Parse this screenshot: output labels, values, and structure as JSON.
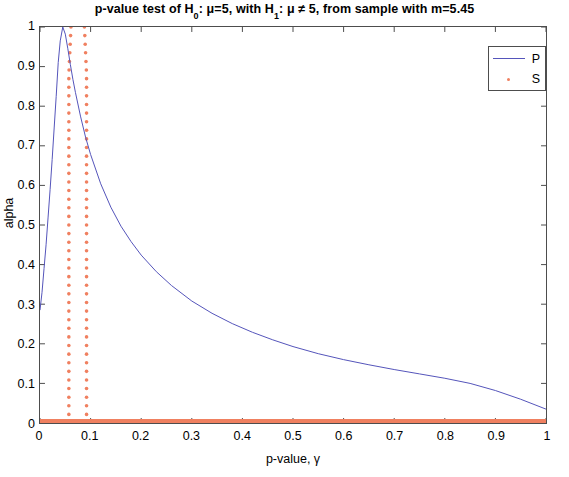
{
  "chart_data": {
    "type": "line",
    "title_parts": {
      "a": "p-value test of  H",
      "sub1": "0",
      "b": ": μ=5, with H",
      "sub2": "1",
      "c": ": μ ≠ 5, from sample with m=5.45"
    },
    "xlabel": "p-value, γ",
    "ylabel": "alpha",
    "xlim": [
      0,
      1
    ],
    "ylim": [
      0,
      1
    ],
    "grid": false,
    "legend_position": "top-right",
    "legend": [
      {
        "name": "P",
        "marker": "line",
        "color": "#5555bb"
      },
      {
        "name": "S",
        "marker": "dot",
        "color": "#f08060"
      }
    ],
    "xticks": [
      "0",
      "0.1",
      "0.2",
      "0.3",
      "0.4",
      "0.5",
      "0.6",
      "0.7",
      "0.8",
      "0.9",
      "1"
    ],
    "xtick_values": [
      0,
      0.1,
      0.2,
      0.3,
      0.4,
      0.5,
      0.6,
      0.7,
      0.8,
      0.9,
      1
    ],
    "yticks": [
      "0",
      "0.1",
      "0.2",
      "0.3",
      "0.4",
      "0.5",
      "0.6",
      "0.7",
      "0.8",
      "0.9",
      "1"
    ],
    "ytick_values": [
      0,
      0.1,
      0.2,
      0.3,
      0.4,
      0.5,
      0.6,
      0.7,
      0.8,
      0.9,
      1
    ],
    "series": [
      {
        "name": "P",
        "type": "line",
        "color": "#5555bb",
        "x": [
          0.0,
          0.004,
          0.008,
          0.012,
          0.016,
          0.02,
          0.024,
          0.028,
          0.032,
          0.036,
          0.04,
          0.045,
          0.05,
          0.055,
          0.06,
          0.065,
          0.07,
          0.08,
          0.09,
          0.1,
          0.12,
          0.14,
          0.16,
          0.18,
          0.2,
          0.23,
          0.26,
          0.3,
          0.34,
          0.38,
          0.42,
          0.46,
          0.5,
          0.55,
          0.6,
          0.65,
          0.7,
          0.75,
          0.8,
          0.85,
          0.9,
          0.95,
          1.0
        ],
        "y": [
          0.285,
          0.33,
          0.39,
          0.45,
          0.52,
          0.59,
          0.665,
          0.745,
          0.825,
          0.91,
          0.965,
          1.0,
          0.982,
          0.945,
          0.905,
          0.868,
          0.835,
          0.775,
          0.722,
          0.678,
          0.604,
          0.545,
          0.497,
          0.458,
          0.424,
          0.382,
          0.347,
          0.308,
          0.277,
          0.251,
          0.229,
          0.21,
          0.193,
          0.175,
          0.16,
          0.147,
          0.135,
          0.124,
          0.113,
          0.1,
          0.082,
          0.06,
          0.035
        ]
      },
      {
        "name": "S",
        "type": "scatter-vertical-lines",
        "color": "#f08060",
        "vertical_lines_x": [
          0.057,
          0.092
        ],
        "vertical_lines_y_range": [
          0.0,
          1.0
        ],
        "baseline_y": 0.0,
        "baseline_x_range": [
          0.0,
          1.0
        ],
        "note": "two near-vertical dotted columns rising from alpha=0 to alpha=1, plus a thick marker band along alpha=0"
      }
    ],
    "annotations": {
      "peak_x": 0.045,
      "peak_y": 1.0,
      "left_edge_y": 0.285,
      "right_edge_y": 0.035
    }
  }
}
